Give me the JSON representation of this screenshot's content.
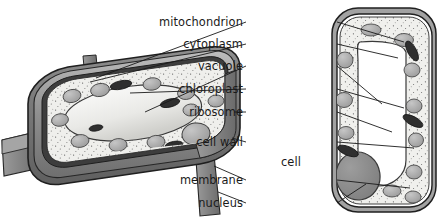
{
  "diagram": {
    "labels": [
      {
        "id": "mitochondrion",
        "text": "mitochondrion"
      },
      {
        "id": "cytoplasm",
        "text": "cytoplasm"
      },
      {
        "id": "vacuole",
        "text": "vacuole"
      },
      {
        "id": "chloroplast",
        "text": "chloroplast"
      },
      {
        "id": "ribosome",
        "text": "ribosome"
      },
      {
        "id": "cell-wall",
        "text": "cell wall"
      },
      {
        "id": "cell-membrane-line1",
        "text": "cell"
      },
      {
        "id": "cell-membrane-line2",
        "text": "membrane"
      },
      {
        "id": "nucleus",
        "text": "nucleus"
      }
    ],
    "colors": {
      "ink": "#1a1a1a",
      "wall_dark": "#6d6d6d",
      "wall_mid": "#8e8e8e",
      "wall_light": "#b9b9b9",
      "cytoplasm": "#efefec",
      "vacuole": "#f4f4f2",
      "organelle_grey": "#a9a9a9",
      "nucleus_grey": "#8a8a8a",
      "mitochondrion_dark": "#2f2f2f",
      "background": "#ffffff"
    },
    "structures": {
      "left_cell": "plant cell, three-dimensional cut-away box",
      "right_cell": "cell cross-section, tall rounded rectangle"
    }
  }
}
